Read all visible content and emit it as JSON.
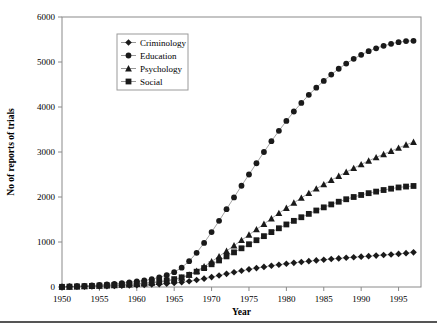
{
  "figure": {
    "caption_rule": "horizontal-divider"
  },
  "chart_data": {
    "type": "line",
    "title": "",
    "xlabel": "Year",
    "ylabel": "No of reports of trials",
    "xlim": [
      1950,
      1998
    ],
    "ylim": [
      0,
      6000
    ],
    "grid": false,
    "legend_position": "upper-left-inside",
    "x_ticks": [
      1950,
      1955,
      1960,
      1965,
      1970,
      1975,
      1980,
      1985,
      1990,
      1995
    ],
    "y_ticks": [
      0,
      1000,
      2000,
      3000,
      4000,
      5000,
      6000
    ],
    "x": [
      1950,
      1951,
      1952,
      1953,
      1954,
      1955,
      1956,
      1957,
      1958,
      1959,
      1960,
      1961,
      1962,
      1963,
      1964,
      1965,
      1966,
      1967,
      1968,
      1969,
      1970,
      1971,
      1972,
      1973,
      1974,
      1975,
      1976,
      1977,
      1978,
      1979,
      1980,
      1981,
      1982,
      1983,
      1984,
      1985,
      1986,
      1987,
      1988,
      1989,
      1990,
      1991,
      1992,
      1993,
      1994,
      1995,
      1996,
      1997
    ],
    "series": [
      {
        "name": "Criminology",
        "marker": "diamond",
        "color": "#1a1a1a",
        "values": [
          2,
          4,
          6,
          9,
          12,
          15,
          19,
          23,
          28,
          33,
          39,
          46,
          54,
          63,
          74,
          88,
          105,
          128,
          155,
          186,
          220,
          256,
          292,
          327,
          360,
          392,
          420,
          447,
          472,
          495,
          517,
          537,
          556,
          574,
          591,
          607,
          622,
          636,
          650,
          662,
          674,
          686,
          698,
          710,
          722,
          736,
          752,
          770
        ]
      },
      {
        "name": "Education",
        "marker": "circle",
        "color": "#1a1a1a",
        "values": [
          5,
          11,
          18,
          26,
          35,
          45,
          57,
          70,
          85,
          102,
          122,
          146,
          175,
          212,
          262,
          330,
          430,
          575,
          760,
          980,
          1220,
          1470,
          1730,
          1990,
          2250,
          2500,
          2750,
          3000,
          3240,
          3470,
          3690,
          3900,
          4090,
          4270,
          4430,
          4580,
          4720,
          4850,
          4965,
          5070,
          5160,
          5240,
          5305,
          5360,
          5405,
          5440,
          5465,
          5470
        ]
      },
      {
        "name": "Psychology",
        "marker": "triangle",
        "color": "#1a1a1a",
        "values": [
          3,
          6,
          10,
          14,
          19,
          25,
          31,
          38,
          46,
          55,
          65,
          77,
          91,
          108,
          130,
          160,
          205,
          270,
          355,
          455,
          565,
          680,
          800,
          920,
          1040,
          1160,
          1280,
          1400,
          1520,
          1640,
          1755,
          1870,
          1980,
          2085,
          2185,
          2280,
          2375,
          2465,
          2555,
          2640,
          2725,
          2805,
          2880,
          2950,
          3020,
          3090,
          3160,
          3220
        ]
      },
      {
        "name": "Social",
        "marker": "square",
        "color": "#1a1a1a",
        "values": [
          4,
          8,
          13,
          18,
          24,
          31,
          38,
          46,
          55,
          65,
          76,
          89,
          104,
          122,
          145,
          175,
          215,
          270,
          340,
          420,
          505,
          590,
          680,
          770,
          860,
          950,
          1040,
          1130,
          1220,
          1305,
          1390,
          1470,
          1550,
          1625,
          1700,
          1770,
          1835,
          1895,
          1950,
          2000,
          2045,
          2085,
          2120,
          2155,
          2185,
          2212,
          2232,
          2245
        ]
      }
    ]
  }
}
